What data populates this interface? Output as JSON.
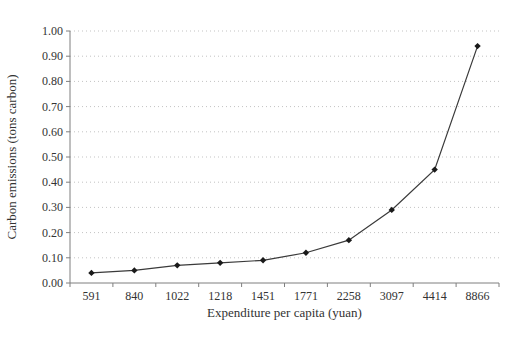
{
  "chart_data": {
    "type": "line",
    "categories": [
      "591",
      "840",
      "1022",
      "1218",
      "1451",
      "1771",
      "2258",
      "3097",
      "4414",
      "8866"
    ],
    "values": [
      0.04,
      0.05,
      0.07,
      0.08,
      0.09,
      0.12,
      0.17,
      0.29,
      0.45,
      0.94
    ],
    "xlabel": "Expenditure per capita (yuan)",
    "ylabel": "Carbon emissions (tons carbon)",
    "ylim": [
      0,
      1.0
    ],
    "ytick_step": 0.1,
    "ytick_labels": [
      "0.00",
      "0.10",
      "0.20",
      "0.30",
      "0.40",
      "0.50",
      "0.60",
      "0.70",
      "0.80",
      "0.90",
      "1.00"
    ],
    "grid": "horizontal-dotted",
    "legend": "none",
    "marker": "diamond",
    "colors": {
      "line": "#3a3a3a",
      "marker": "#1a1a1a",
      "grid": "#c3c3c3",
      "axis": "#7f7f7f",
      "text": "#333333",
      "background": "#ffffff"
    }
  }
}
